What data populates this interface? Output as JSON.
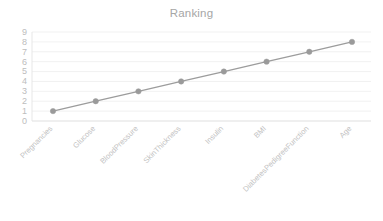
{
  "chart_data": {
    "type": "line",
    "title": "Ranking",
    "xlabel": "",
    "ylabel": "",
    "categories": [
      "Pregnancies",
      "Glucose",
      "BloodPressure",
      "SkinThickness",
      "Insulin",
      "BMI",
      "DiabetesPedigreeFunction",
      "Age"
    ],
    "values": [
      1,
      2,
      3,
      4,
      5,
      6,
      7,
      8
    ],
    "series": [
      {
        "name": "Ranking",
        "values": [
          1,
          2,
          3,
          4,
          5,
          6,
          7,
          8
        ]
      }
    ],
    "ylim": [
      0,
      9
    ],
    "yticks": [
      9,
      8,
      7,
      6,
      5,
      4,
      3,
      2,
      1,
      0
    ],
    "ytick_labels": [
      "9",
      "8",
      "7",
      "6",
      "5",
      "4",
      "3",
      "2",
      "1",
      "0"
    ],
    "grid": true,
    "legend": false,
    "legend_position": "none",
    "marker": "circle",
    "xtick_rotation": -45,
    "colors": {
      "line": "#9c9c9c",
      "marker": "#9a9a9a",
      "grid": "#eeeeee",
      "title_text": "#a6a6a6",
      "tick_text": "#c2c2c2",
      "background": "#ffffff"
    }
  }
}
